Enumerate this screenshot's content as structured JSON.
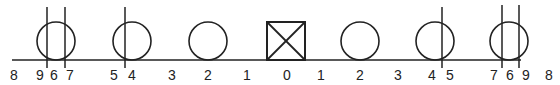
{
  "diagram": {
    "baseline": {
      "x1": 12,
      "x2": 521,
      "y": 60
    },
    "color": "#222222",
    "shapes": [
      {
        "type": "circle",
        "cx": 56,
        "label": "left-6"
      },
      {
        "type": "circle",
        "cx": 132,
        "label": "left-4"
      },
      {
        "type": "circle",
        "cx": 208,
        "label": "left-2"
      },
      {
        "type": "box-x",
        "cx": 286,
        "label": "center-0"
      },
      {
        "type": "circle",
        "cx": 360,
        "label": "right-2"
      },
      {
        "type": "circle",
        "cx": 435,
        "label": "right-4"
      },
      {
        "type": "circle",
        "cx": 509,
        "label": "right-6"
      }
    ],
    "vertical_lines": [
      {
        "x": 47,
        "y1": 7,
        "y2": 68
      },
      {
        "x": 65,
        "y1": 7,
        "y2": 68
      },
      {
        "x": 125,
        "y1": 7,
        "y2": 68
      },
      {
        "x": 442,
        "y1": 7,
        "y2": 68
      },
      {
        "x": 502,
        "y1": 5,
        "y2": 68
      },
      {
        "x": 519,
        "y1": 5,
        "y2": 68
      }
    ],
    "tick_labels": [
      {
        "x": 14,
        "text": "8"
      },
      {
        "x": 40,
        "text": "9"
      },
      {
        "x": 54,
        "text": "6"
      },
      {
        "x": 70,
        "text": "7"
      },
      {
        "x": 114,
        "text": "5"
      },
      {
        "x": 132,
        "text": "4"
      },
      {
        "x": 172,
        "text": "3"
      },
      {
        "x": 208,
        "text": "2"
      },
      {
        "x": 247,
        "text": "1"
      },
      {
        "x": 287,
        "text": "0"
      },
      {
        "x": 321,
        "text": "1"
      },
      {
        "x": 360,
        "text": "2"
      },
      {
        "x": 398,
        "text": "3"
      },
      {
        "x": 432,
        "text": "4"
      },
      {
        "x": 450,
        "text": "5"
      },
      {
        "x": 494,
        "text": "7"
      },
      {
        "x": 510,
        "text": "6"
      },
      {
        "x": 526,
        "text": "9"
      },
      {
        "x": 549,
        "text": "8"
      }
    ]
  }
}
